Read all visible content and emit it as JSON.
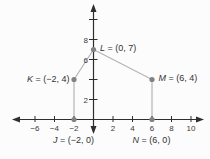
{
  "figure": {
    "background": "#fcfcfc"
  },
  "chart_data": {
    "type": "scatter",
    "title": "",
    "xlabel": "",
    "ylabel": "",
    "xlim": [
      -8.2,
      11.5
    ],
    "ylim": [
      -1.95,
      11.6
    ],
    "grid": false,
    "legend": null,
    "x_ticks": [
      -6,
      -4,
      -2,
      2,
      4,
      6,
      8,
      10
    ],
    "x_tick_labels": [
      "−6",
      "−4",
      "−2",
      "2",
      "4",
      "6",
      "8",
      "10"
    ],
    "y_ticks": [
      2,
      4,
      6,
      8,
      10
    ],
    "y_tick_labels": [
      {
        "value": 2,
        "label": "2"
      },
      {
        "value": 6,
        "label": "6"
      },
      {
        "value": 8,
        "label": "8"
      }
    ],
    "points": [
      {
        "name": "J",
        "x": -2,
        "y": 0,
        "label": "J = (−2, 0)",
        "label_pos": "below"
      },
      {
        "name": "K",
        "x": -2,
        "y": 4,
        "label": "K = (−2, 4)",
        "label_pos": "left"
      },
      {
        "name": "L",
        "x": 0,
        "y": 7,
        "label": "L = (0, 7)",
        "label_pos": "right"
      },
      {
        "name": "M",
        "x": 6,
        "y": 4,
        "label": "M = (6, 4)",
        "label_pos": "right"
      },
      {
        "name": "N",
        "x": 6,
        "y": 0,
        "label": "N = (6, 0)",
        "label_pos": "below"
      }
    ],
    "polygon": [
      "J",
      "K",
      "L",
      "M",
      "N"
    ],
    "colors": {
      "background": "#fcfcfc",
      "axis": "#2e2e2e",
      "tick_label": "#3a3a3a",
      "shape_line": "#b5b5b5",
      "point_fill": "#828282",
      "point_label": "#333333"
    }
  }
}
